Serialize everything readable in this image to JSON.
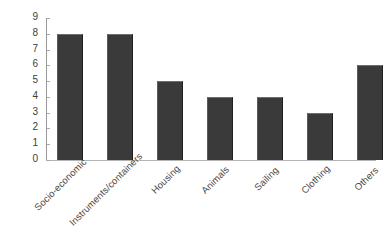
{
  "chart_data": {
    "type": "bar",
    "title": "",
    "xlabel": "",
    "ylabel": "",
    "ylim": [
      0,
      9
    ],
    "yticks": [
      "0",
      "1",
      "2",
      "3",
      "4",
      "5",
      "6",
      "7",
      "8",
      "9"
    ],
    "grid": false,
    "legend": false,
    "bar_color": "#3a3a3a",
    "categories": [
      "Socio-economic",
      "Instruments/containers",
      "Housing",
      "Animals",
      "Sailing",
      "Clothing",
      "Others"
    ],
    "values": [
      8,
      8,
      5,
      4,
      4,
      3,
      6
    ]
  }
}
